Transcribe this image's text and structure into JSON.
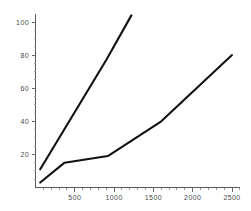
{
  "chart_data": {
    "type": "line",
    "title": "",
    "subtitle": "",
    "xlabel": "",
    "ylabel": "",
    "xlim": [
      0,
      2600
    ],
    "ylim": [
      0,
      108
    ],
    "grid": false,
    "legend": false,
    "legend_position": "none",
    "line_color": "#111111",
    "axis_color": "#5a5a5a",
    "background": "#ffffff",
    "xticks": [
      500,
      1000,
      1500,
      2000,
      2500
    ],
    "xtick_labels": [
      "500",
      "1000",
      "1500",
      "2000",
      "2500"
    ],
    "yticks": [
      20,
      40,
      60,
      80,
      100
    ],
    "ytick_labels": [
      "20",
      "40",
      "60",
      "80",
      "100"
    ],
    "series": [
      {
        "name": "steep",
        "x": [
          60,
          900,
          1220
        ],
        "y": [
          11,
          77,
          104
        ]
      },
      {
        "name": "shallow",
        "x": [
          60,
          370,
          920,
          1600,
          2500
        ],
        "y": [
          3,
          15,
          19,
          40,
          80
        ]
      }
    ]
  },
  "axes": {
    "y_tick_0": "20",
    "y_tick_1": "40",
    "y_tick_2": "60",
    "y_tick_3": "80",
    "y_tick_4": "100",
    "x_tick_0": "500",
    "x_tick_1": "1000",
    "x_tick_2": "1500",
    "x_tick_3": "2000",
    "x_tick_4": "2500"
  }
}
